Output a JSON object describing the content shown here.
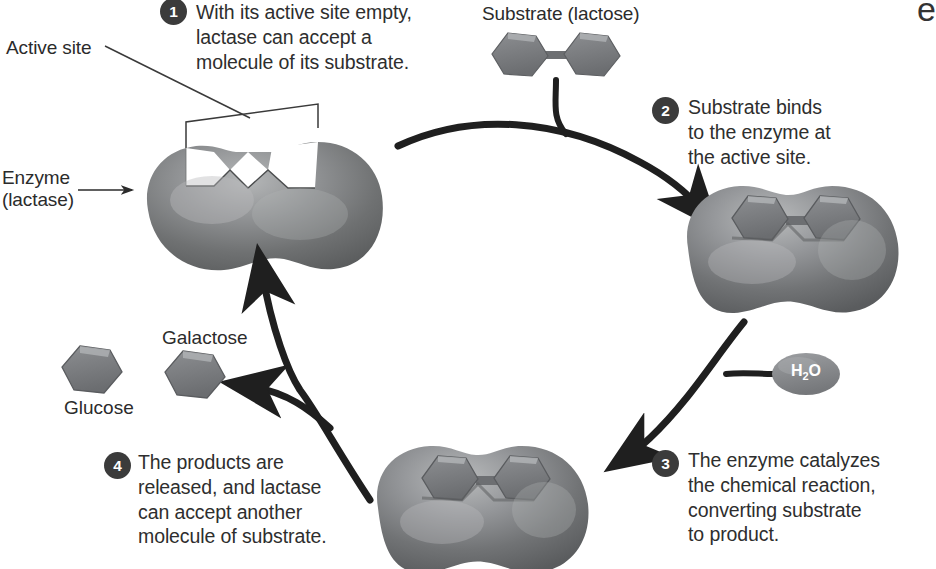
{
  "diagram": {
    "background_color": "#ffffff",
    "enzyme_color": "#6f7172",
    "enzyme_highlight": "#a7a9aa",
    "molecule_color": "#75777a",
    "badge_color": "#3b3b3b",
    "arrow_color": "#1f1f1f",
    "text_color": "#2b2b2b",
    "edge_clipped_char": "e"
  },
  "labels": {
    "active_site": "Active site",
    "enzyme_line1": "Enzyme",
    "enzyme_line2": "(lactase)",
    "substrate": "Substrate (lactose)",
    "glucose": "Glucose",
    "galactose": "Galactose",
    "water": "H2O",
    "water_formula_prefix": "H",
    "water_formula_sub": "2",
    "water_formula_suffix": "O"
  },
  "steps": [
    {
      "number": "1",
      "text": "With its active site empty,\nlactase can accept a\nmolecule of its substrate."
    },
    {
      "number": "2",
      "text": "Substrate binds\nto the enzyme at\nthe active site."
    },
    {
      "number": "3",
      "text": "The enzyme catalyzes\nthe chemical reaction,\nconverting substrate\nto product."
    },
    {
      "number": "4",
      "text": "The products are\nreleased, and lactase\ncan accept another\nmolecule of substrate."
    }
  ],
  "shapes": {
    "enzyme_top_left": {
      "name": "enzyme-empty-active-site",
      "cx": 232,
      "cy": 215
    },
    "enzyme_right": {
      "name": "enzyme-substrate-bound",
      "cx": 777,
      "cy": 248
    },
    "enzyme_bottom": {
      "name": "enzyme-catalyzing",
      "cx": 490,
      "cy": 508
    },
    "substrate_free": {
      "name": "lactose-molecule-free",
      "cx": 557,
      "cy": 55
    },
    "glucose_product": {
      "name": "glucose-hexagon",
      "cx": 95,
      "cy": 370
    },
    "galactose_product": {
      "name": "galactose-hexagon",
      "cx": 198,
      "cy": 375
    },
    "water_pill": {
      "name": "water-molecule-pill",
      "cx": 806,
      "cy": 374
    }
  }
}
